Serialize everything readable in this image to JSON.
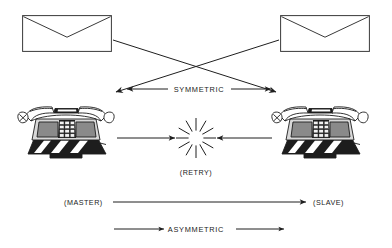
{
  "figure": {
    "type": "technical-line-diagram",
    "background_color": "#ffffff",
    "ink_color": "#1f1f1f"
  },
  "labels": {
    "symmetric": "SYMMETRIC",
    "retry": "(RETRY)",
    "master": "(MASTER)",
    "slave": "(SLAVE)",
    "asymmetric": "ASYMMETRIC"
  },
  "objects": {
    "envelope_left": {
      "icon": "envelope-icon",
      "position": "top-left"
    },
    "envelope_right": {
      "icon": "envelope-icon",
      "position": "top-right"
    },
    "telephone_left": {
      "icon": "telephone-icon",
      "position": "middle-left",
      "keypad_rows": 4,
      "keypad_cols": 3
    },
    "telephone_right": {
      "icon": "telephone-icon",
      "position": "middle-right",
      "keypad_rows": 4,
      "keypad_cols": 3
    },
    "collision_burst": {
      "icon": "starburst-collision-icon",
      "position": "center",
      "rays": 12
    }
  },
  "connectors": [
    {
      "name": "cross-left-envelope-to-right-phone",
      "style": "single-arrow",
      "direction": "down-right"
    },
    {
      "name": "cross-right-envelope-to-left-phone",
      "style": "single-arrow",
      "direction": "down-left"
    },
    {
      "name": "symmetric-bidirectional",
      "style": "double-arrow",
      "direction": "both",
      "label": "SYMMETRIC"
    },
    {
      "name": "retry-left-to-burst",
      "style": "single-arrow",
      "direction": "right"
    },
    {
      "name": "retry-right-to-burst",
      "style": "single-arrow",
      "direction": "left"
    },
    {
      "name": "master-to-slave",
      "style": "single-arrow",
      "direction": "right"
    },
    {
      "name": "asymmetric-left-segment",
      "style": "single-arrow",
      "direction": "right"
    },
    {
      "name": "asymmetric-right-segment",
      "style": "single-arrow",
      "direction": "right"
    }
  ]
}
